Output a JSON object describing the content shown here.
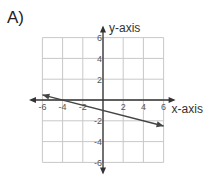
{
  "problem": {
    "label": "A)"
  },
  "chart_data": {
    "type": "line",
    "title": "",
    "xlabel": "x-axis",
    "ylabel": "y-axis",
    "xlim": [
      -6,
      6
    ],
    "ylim": [
      -6,
      6
    ],
    "grid": true,
    "grid_step": 2,
    "x_ticks": [
      -6,
      -4,
      -2,
      2,
      4,
      6
    ],
    "y_ticks": [
      6,
      4,
      2,
      -2,
      -4,
      -6
    ],
    "x_tick_labels": [
      "-6",
      "-4",
      "-2",
      "2",
      "4",
      "6"
    ],
    "y_tick_labels": [
      "6",
      "4",
      "2",
      "-2",
      "-4",
      "-6"
    ],
    "series": [
      {
        "name": "line",
        "equation": "y = -x/4 - 1",
        "x": [
          -6,
          6
        ],
        "y": [
          0.5,
          -2.5
        ],
        "arrows_both_ends": true
      }
    ],
    "colors": {
      "line": "#444444",
      "grid": "#c8c8c8",
      "axis": "#333333"
    }
  }
}
